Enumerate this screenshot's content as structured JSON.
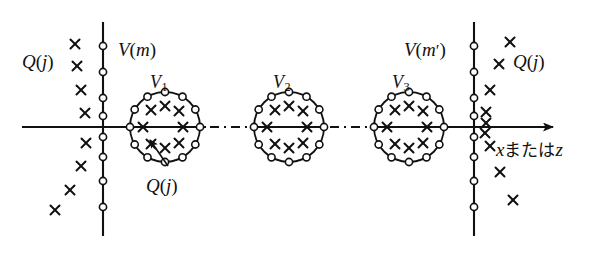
{
  "figure": {
    "background_color": "#ffffff",
    "ink_color": "#111111"
  },
  "labels": {
    "v_m": {
      "text": "V(m)",
      "base": "V",
      "arg": "(m)",
      "x": 118,
      "y": 40
    },
    "v_m_prime": {
      "text": "V(m′)",
      "base": "V",
      "arg": "(m′)",
      "x": 404,
      "y": 40
    },
    "v1": {
      "base": "V",
      "sub": "1",
      "x": 150,
      "y": 73
    },
    "v2": {
      "base": "V",
      "sub": "2",
      "x": 273,
      "y": 73
    },
    "v3": {
      "base": "V",
      "sub": "3",
      "x": 392,
      "y": 73
    },
    "q_left": {
      "text": "Q(j)",
      "x": 22,
      "y": 52
    },
    "q_right": {
      "text": "Q(j)",
      "x": 513,
      "y": 52
    },
    "q_callout": {
      "text": "Q(j)",
      "x": 146,
      "y": 176
    },
    "axis": {
      "text": "xまたはz",
      "var1": "x",
      "conj": "または",
      "var2": "z",
      "x": 496,
      "y": 140
    }
  },
  "axes": {
    "horizontal": {
      "y": 127,
      "x_start": 22,
      "x_end": 553,
      "arrow": true
    },
    "vertical_left": {
      "x": 103,
      "y_start": 22,
      "y_end": 236
    },
    "vertical_right": {
      "x": 474,
      "y_start": 22,
      "y_end": 236
    }
  },
  "vertical_nodes": {
    "marker": "open-circle",
    "radius": 3.6,
    "left_x": 103,
    "right_x": 474,
    "y_values": [
      46,
      72,
      98,
      116,
      137,
      157,
      181,
      207
    ]
  },
  "clusters": [
    {
      "name": "V1",
      "cx": 165,
      "cy": 127,
      "r": 35,
      "boundary_nodes": 12,
      "inner_crosses": [
        {
          "x": -14,
          "y": -17
        },
        {
          "x": 0,
          "y": -21
        },
        {
          "x": 14,
          "y": -16
        },
        {
          "x": -22,
          "y": 0
        },
        {
          "x": 18,
          "y": 0
        },
        {
          "x": -14,
          "y": 17
        },
        {
          "x": 0,
          "y": 21
        },
        {
          "x": 14,
          "y": 16
        }
      ]
    },
    {
      "name": "V2",
      "cx": 289,
      "cy": 127,
      "r": 35,
      "boundary_nodes": 12,
      "inner_crosses": [
        {
          "x": -14,
          "y": -17
        },
        {
          "x": 0,
          "y": -21
        },
        {
          "x": 14,
          "y": -16
        },
        {
          "x": -22,
          "y": 0
        },
        {
          "x": 18,
          "y": 0
        },
        {
          "x": -14,
          "y": 17
        },
        {
          "x": 0,
          "y": 21
        },
        {
          "x": 14,
          "y": 16
        }
      ]
    },
    {
      "name": "V3",
      "cx": 409,
      "cy": 127,
      "r": 35,
      "boundary_nodes": 12,
      "inner_crosses": [
        {
          "x": -14,
          "y": -17
        },
        {
          "x": 0,
          "y": -21
        },
        {
          "x": 14,
          "y": -16
        },
        {
          "x": -22,
          "y": 0
        },
        {
          "x": 18,
          "y": 0
        },
        {
          "x": -14,
          "y": 17
        },
        {
          "x": 0,
          "y": 21
        },
        {
          "x": 14,
          "y": 16
        }
      ]
    }
  ],
  "dash_dot_gaps": [
    {
      "x_start": 206,
      "x_end": 252
    },
    {
      "x_start": 326,
      "x_end": 372
    }
  ],
  "left_crosses": [
    {
      "x": 75,
      "y": 44
    },
    {
      "x": 77,
      "y": 66
    },
    {
      "x": 81,
      "y": 90
    },
    {
      "x": 85,
      "y": 113
    },
    {
      "x": 86,
      "y": 143
    },
    {
      "x": 81,
      "y": 166
    },
    {
      "x": 70,
      "y": 190
    },
    {
      "x": 55,
      "y": 210
    }
  ],
  "right_crosses": [
    {
      "x": 510,
      "y": 42
    },
    {
      "x": 499,
      "y": 64
    },
    {
      "x": 490,
      "y": 90
    },
    {
      "x": 486,
      "y": 112
    },
    {
      "x": 486,
      "y": 123
    },
    {
      "x": 485,
      "y": 133
    },
    {
      "x": 490,
      "y": 146
    },
    {
      "x": 500,
      "y": 172
    },
    {
      "x": 513,
      "y": 200
    }
  ],
  "callout_arrow": {
    "from_x": 168,
    "from_y": 166,
    "to_x": 150,
    "to_y": 140,
    "description": "arrow from Q(j) label to a cross inside V1"
  }
}
